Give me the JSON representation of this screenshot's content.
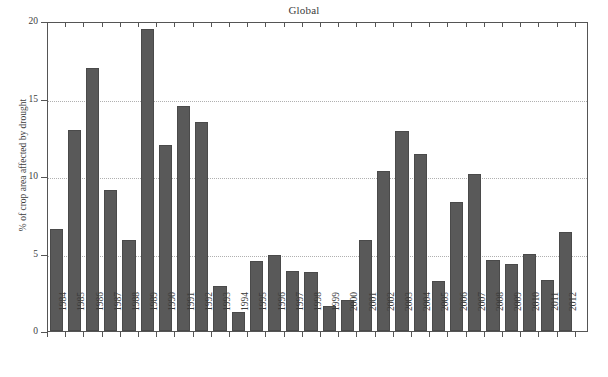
{
  "chart_data": {
    "type": "bar",
    "title": "Global",
    "xlabel": "",
    "ylabel": "% of crop area affected by drought",
    "ylim": [
      0,
      20
    ],
    "yticks": [
      0,
      5,
      10,
      15,
      20
    ],
    "grid": "horizontal-dotted",
    "legend": "none",
    "bar_color": "#595959",
    "categories": [
      "1984",
      "1985",
      "1986",
      "1987",
      "1988",
      "1989",
      "1990",
      "1991",
      "1992",
      "1993",
      "1994",
      "1995",
      "1996",
      "1997",
      "1998",
      "1999",
      "2000",
      "2001",
      "2002",
      "2003",
      "2004",
      "2005",
      "2006",
      "2007",
      "2008",
      "2009",
      "2010",
      "2011",
      "2012"
    ],
    "values": [
      6.6,
      13.0,
      17.0,
      9.1,
      5.9,
      19.5,
      12.0,
      14.5,
      13.5,
      2.9,
      1.2,
      4.5,
      4.9,
      3.9,
      3.8,
      1.6,
      2.0,
      5.9,
      10.3,
      12.9,
      11.4,
      3.2,
      8.3,
      10.1,
      4.6,
      4.3,
      5.0,
      3.3,
      6.4
    ],
    "series": [
      {
        "name": "Global",
        "values": [
          6.6,
          13.0,
          17.0,
          9.1,
          5.9,
          19.5,
          12.0,
          14.5,
          13.5,
          2.9,
          1.2,
          4.5,
          4.9,
          3.9,
          3.8,
          1.6,
          2.0,
          5.9,
          10.3,
          12.9,
          11.4,
          3.2,
          8.3,
          10.1,
          4.6,
          4.3,
          5.0,
          3.3,
          6.4
        ]
      }
    ]
  },
  "axes": {
    "y_tick_labels": [
      "0",
      "5",
      "10",
      "15",
      "20"
    ],
    "x_tick_labels": [
      "1984",
      "1985",
      "1986",
      "1987",
      "1988",
      "1989",
      "1990",
      "1991",
      "1992",
      "1993",
      "1994",
      "1995",
      "1996",
      "1997",
      "1998",
      "1999",
      "2000",
      "2001",
      "2002",
      "2003",
      "2004",
      "2005",
      "2006",
      "2007",
      "2008",
      "2009",
      "2010",
      "2011",
      "2012"
    ]
  }
}
